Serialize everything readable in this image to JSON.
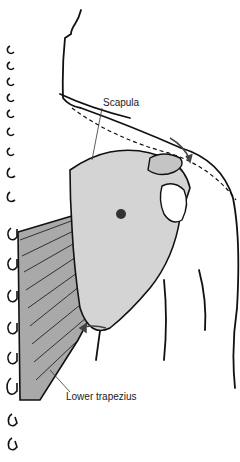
{
  "diagram": {
    "type": "anatomical illustration",
    "labels": {
      "scapula": "Scapula",
      "lower_trapezius": "Lower trapezius"
    },
    "colors": {
      "line": "#111111",
      "bone_fill": "#d4d4d4",
      "muscle_fill": "#a9a9a9",
      "arrow": "#444444",
      "background": "#ffffff"
    }
  }
}
